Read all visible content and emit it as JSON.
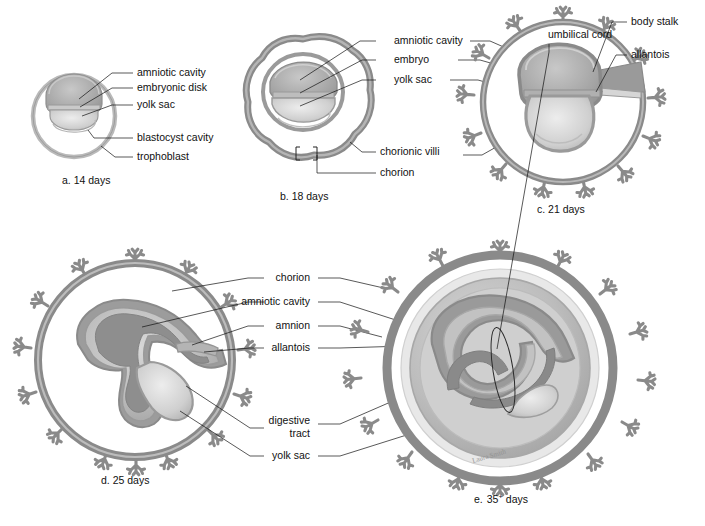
{
  "figure": {
    "background_color": "#ffffff",
    "text_color": "#111111",
    "leader_line_color": "#111111"
  },
  "palette": {
    "chorion_wall": "#8a8a8a",
    "chorion_wall_dark": "#6f6f6f",
    "trophoblast_light": "#b9b9b9",
    "villi": "#8a8a8a",
    "amnion_ring": "#9a9a9a",
    "amniotic_cavity_fill": "#a8a8a8",
    "yolk_sac_fill": "#d2d2d2",
    "embryo_fill": "#9e9e9e",
    "allantois_fill": "#9a9a9a",
    "cavity_white": "#ffffff",
    "ring_pale": "#e4e4e4",
    "ring_mid": "#c4c4c4"
  },
  "panels": [
    {
      "id": "a",
      "caption": "a.  14 days",
      "caption_letter": "a.",
      "caption_text": "14 days",
      "labels": [
        {
          "id": "a-amniotic-cavity",
          "text": "amniotic cavity"
        },
        {
          "id": "a-embryonic-disk",
          "text": "embryonic disk"
        },
        {
          "id": "a-yolk-sac",
          "text": "yolk sac"
        },
        {
          "id": "a-blastocyst-cavity",
          "text": "blastocyst cavity"
        },
        {
          "id": "a-trophoblast",
          "text": "trophoblast"
        }
      ]
    },
    {
      "id": "b",
      "caption": "b.  18 days",
      "caption_letter": "b.",
      "caption_text": "18 days",
      "labels": [
        {
          "id": "b-amniotic-cavity",
          "text": "amniotic cavity"
        },
        {
          "id": "b-embryo",
          "text": "embryo"
        },
        {
          "id": "b-yolk-sac",
          "text": "yolk sac"
        },
        {
          "id": "b-chorionic-villi",
          "text": "chorionic villi"
        },
        {
          "id": "b-chorion",
          "text": "chorion"
        }
      ]
    },
    {
      "id": "c",
      "caption": "c.  21 days",
      "caption_letter": "c.",
      "caption_text": "21 days",
      "labels": [
        {
          "id": "c-body-stalk",
          "text": "body stalk"
        },
        {
          "id": "c-allantois",
          "text": "allantois"
        }
      ]
    },
    {
      "id": "d",
      "caption": "d.  25 days",
      "caption_letter": "d.",
      "caption_text": "25 days",
      "labels": [
        {
          "id": "d-chorion",
          "text": "chorion"
        },
        {
          "id": "d-amniotic-cavity",
          "text": "amniotic cavity"
        },
        {
          "id": "d-amnion",
          "text": "amnion"
        },
        {
          "id": "d-allantois",
          "text": "allantois"
        },
        {
          "id": "d-digestive-tract-line1",
          "text": "digestive"
        },
        {
          "id": "d-digestive-tract-line2",
          "text": "tract"
        },
        {
          "id": "d-yolk-sac",
          "text": "yolk sac"
        }
      ]
    },
    {
      "id": "e",
      "caption": "e. 35+ days",
      "caption_letter": "e.",
      "caption_number": "35",
      "caption_superscript": "+",
      "caption_text": "days",
      "labels": [
        {
          "id": "e-umbilical-cord",
          "text": "umbilical cord"
        }
      ]
    }
  ],
  "signature": "Laura Smith"
}
